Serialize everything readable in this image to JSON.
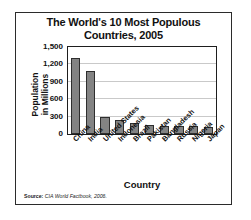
{
  "chart_data": {
    "type": "bar",
    "title": "The World's 10 Most Populous Countries, 2005",
    "title_line1": "The World's 10 Most Populous",
    "title_line2": "Countries, 2005",
    "xlabel": "Country",
    "ylabel": "Population in Millions",
    "ylabel_line1": "Population",
    "ylabel_line2": "in Millions",
    "categories": [
      "China",
      "India",
      "United States",
      "Indonesia",
      "Brazil",
      "Pakistan",
      "Bangladesh",
      "Russia",
      "Nigeria",
      "Japan"
    ],
    "values": [
      1310,
      1090,
      298,
      242,
      186,
      162,
      144,
      143,
      132,
      127
    ],
    "ylim": [
      0,
      1500
    ],
    "yticks": [
      0,
      300,
      600,
      900,
      1200,
      1500
    ],
    "ytick_labels": [
      "0",
      "300",
      "600",
      "900",
      "1,200",
      "1,500"
    ],
    "grid": true,
    "legend": false,
    "bar_color": "#838383",
    "bar_border_color": "#2e2e2e"
  },
  "source": {
    "label": "Source:",
    "text": "CIA World Factbook, 2006."
  }
}
